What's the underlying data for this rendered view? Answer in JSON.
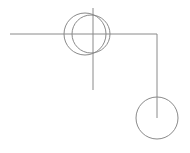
{
  "canvas": {
    "width": 190,
    "height": 153,
    "background_color": "#ffffff",
    "stroke_color": "#8a8a8a",
    "stroke_width": 1
  },
  "figure": {
    "title": "",
    "shapes": [
      {
        "name": "horizontal-baseline",
        "type": "line",
        "x1": 10,
        "y1": 34,
        "x2": 157,
        "y2": 34,
        "color": "#8a8a8a",
        "width": 1
      },
      {
        "name": "left-vertical-axis",
        "type": "line",
        "x1": 93,
        "y1": 8,
        "x2": 93,
        "y2": 90,
        "color": "#8a8a8a",
        "width": 1
      },
      {
        "name": "right-vertical-drop",
        "type": "line",
        "x1": 157,
        "y1": 34,
        "x2": 157,
        "y2": 118,
        "color": "#8a8a8a",
        "width": 1
      },
      {
        "name": "left-circle",
        "type": "circle",
        "cx": 85,
        "cy": 34,
        "r": 21,
        "color": "#8a8a8a",
        "width": 1
      },
      {
        "name": "right-circle",
        "type": "circle",
        "cx": 91,
        "cy": 34,
        "r": 19,
        "color": "#8a8a8a",
        "width": 1
      },
      {
        "name": "bottom-circle",
        "type": "circle",
        "cx": 157,
        "cy": 118,
        "r": 21,
        "color": "#8a8a8a",
        "width": 1
      }
    ]
  }
}
